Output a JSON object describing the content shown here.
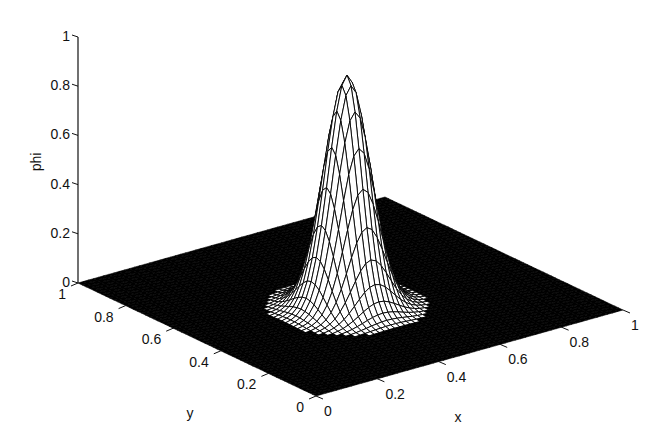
{
  "chart_data": {
    "type": "surface",
    "title": "",
    "xlabel": "x",
    "ylabel": "y",
    "zlabel": "phi",
    "xlim": [
      0,
      1
    ],
    "ylim": [
      0,
      1
    ],
    "zlim": [
      0,
      1
    ],
    "x_ticks": [
      "0",
      "0.2",
      "0.4",
      "0.6",
      "0.8",
      "1"
    ],
    "y_ticks": [
      "0",
      "0.2",
      "0.4",
      "0.6",
      "0.8",
      "1"
    ],
    "z_ticks": [
      "0",
      "0.2",
      "0.4",
      "0.6",
      "0.8",
      "1"
    ],
    "grid": false,
    "legend": null,
    "surface": {
      "function": "gaussian bump",
      "peak_value": 0.94,
      "peak_center": {
        "x": 0.45,
        "y": 0.45
      },
      "width_sigma": 0.06,
      "baseline": 0,
      "mesh_color": "#000000",
      "face_color": "#ffffff"
    }
  },
  "colors": {
    "background": "#ffffff",
    "mesh": "#000000",
    "axis": "#111111"
  }
}
